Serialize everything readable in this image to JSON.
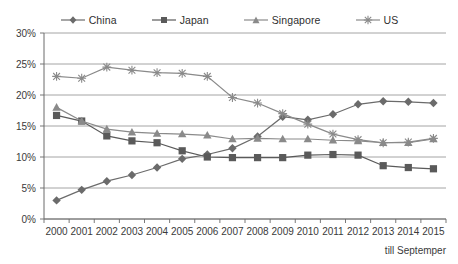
{
  "chart_data": {
    "type": "line",
    "title": "",
    "subtitle": "",
    "xlabel": "",
    "ylabel": "",
    "footnote": "till Septemper",
    "grid": "horizontal",
    "legend_position": "top",
    "ylim": [
      0,
      30
    ],
    "yunit": "%",
    "yticks": [
      0,
      5,
      10,
      15,
      20,
      25,
      30
    ],
    "ytick_labels": [
      "0%",
      "5%",
      "10%",
      "15%",
      "20%",
      "25%",
      "30%"
    ],
    "categories": [
      "2000",
      "2001",
      "2002",
      "2003",
      "2004",
      "2005",
      "2006",
      "2007",
      "2008",
      "2009",
      "2010",
      "2011",
      "2012",
      "2013",
      "2014",
      "2015"
    ],
    "series": [
      {
        "name": "China",
        "marker": "diamond",
        "color": "#6b6b6b",
        "values": [
          3.0,
          4.7,
          6.1,
          7.1,
          8.3,
          9.7,
          10.4,
          11.4,
          13.3,
          16.5,
          16.0,
          16.9,
          18.5,
          19.0,
          18.9,
          18.7
        ]
      },
      {
        "name": "Japan",
        "marker": "square",
        "color": "#5a5a5a",
        "values": [
          16.7,
          15.8,
          13.4,
          12.6,
          12.3,
          11.0,
          10.0,
          9.9,
          9.9,
          9.9,
          10.3,
          10.4,
          10.3,
          8.6,
          8.3,
          8.1
        ]
      },
      {
        "name": "Singapore",
        "marker": "triangle",
        "color": "#8a8a8a",
        "values": [
          18.0,
          15.8,
          14.5,
          14.0,
          13.8,
          13.7,
          13.5,
          12.9,
          13.0,
          12.9,
          12.9,
          12.7,
          12.6,
          12.3,
          12.3,
          12.9
        ]
      },
      {
        "name": "US",
        "marker": "cross",
        "color": "#8a8a8a",
        "values": [
          23.0,
          22.7,
          24.5,
          24.0,
          23.6,
          23.5,
          23.0,
          19.6,
          18.7,
          17.0,
          15.3,
          13.7,
          12.8,
          12.3,
          12.4,
          13.0
        ]
      }
    ]
  },
  "legend": {
    "items": [
      {
        "label": "China"
      },
      {
        "label": "Japan"
      },
      {
        "label": "Singapore"
      },
      {
        "label": "US"
      }
    ]
  }
}
